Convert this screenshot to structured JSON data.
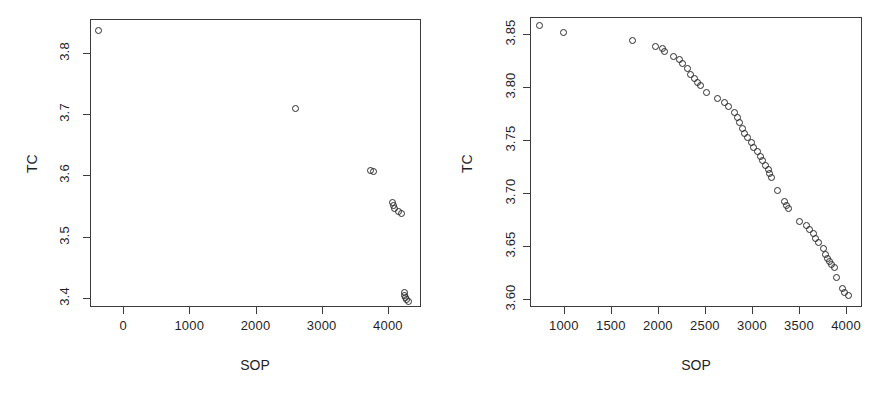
{
  "figure": {
    "background": "#ffffff",
    "point_color": "#2b2b2b",
    "axis_color": "#3c3c3c",
    "panel_count": 2
  },
  "chart_data": [
    {
      "id": "left-panel",
      "type": "scatter",
      "title": "",
      "xlabel": "SOP",
      "ylabel": "TC",
      "xticks": [
        0,
        1000,
        2000,
        3000,
        4000
      ],
      "xtick_labels": [
        "0",
        "1000",
        "2000",
        "3000",
        "4000"
      ],
      "yticks": [
        3.4,
        3.5,
        3.6,
        3.7,
        3.8
      ],
      "ytick_labels": [
        "3.4",
        "3.5",
        "3.6",
        "3.7",
        "3.8"
      ],
      "xlim": [
        -500,
        4500
      ],
      "ylim": [
        3.385,
        3.855
      ],
      "grid": false,
      "legend": null,
      "marker": "open-circle",
      "points": [
        {
          "x": -380,
          "y": 3.838
        },
        {
          "x": 2595,
          "y": 3.71
        },
        {
          "x": 3720,
          "y": 3.61
        },
        {
          "x": 3760,
          "y": 3.608
        },
        {
          "x": 4060,
          "y": 3.557
        },
        {
          "x": 4075,
          "y": 3.553
        },
        {
          "x": 4085,
          "y": 3.548
        },
        {
          "x": 4145,
          "y": 3.543
        },
        {
          "x": 4195,
          "y": 3.54
        },
        {
          "x": 4230,
          "y": 3.41
        },
        {
          "x": 4240,
          "y": 3.406
        },
        {
          "x": 4245,
          "y": 3.402
        },
        {
          "x": 4260,
          "y": 3.399
        },
        {
          "x": 4290,
          "y": 3.396
        }
      ]
    },
    {
      "id": "right-panel",
      "type": "scatter",
      "title": "",
      "xlabel": "SOP",
      "ylabel": "TC",
      "xticks": [
        1000,
        1500,
        2000,
        2500,
        3000,
        3500,
        4000
      ],
      "xtick_labels": [
        "1000",
        "1500",
        "2000",
        "2500",
        "3000",
        "3500",
        "4000"
      ],
      "yticks": [
        3.6,
        3.65,
        3.7,
        3.75,
        3.8,
        3.85
      ],
      "ytick_labels": [
        "3.60",
        "3.65",
        "3.70",
        "3.75",
        "3.80",
        "3.85"
      ],
      "xlim": [
        640,
        4170
      ],
      "ylim": [
        3.592,
        3.866
      ],
      "grid": false,
      "legend": null,
      "marker": "open-circle",
      "points": [
        {
          "x": 735,
          "y": 3.859
        },
        {
          "x": 985,
          "y": 3.852
        },
        {
          "x": 1715,
          "y": 3.845
        },
        {
          "x": 1960,
          "y": 3.839
        },
        {
          "x": 2035,
          "y": 3.837
        },
        {
          "x": 2060,
          "y": 3.834
        },
        {
          "x": 2155,
          "y": 3.83
        },
        {
          "x": 2215,
          "y": 3.827
        },
        {
          "x": 2250,
          "y": 3.823
        },
        {
          "x": 2300,
          "y": 3.818
        },
        {
          "x": 2340,
          "y": 3.813
        },
        {
          "x": 2375,
          "y": 3.809
        },
        {
          "x": 2415,
          "y": 3.805
        },
        {
          "x": 2440,
          "y": 3.802
        },
        {
          "x": 2510,
          "y": 3.796
        },
        {
          "x": 2625,
          "y": 3.79
        },
        {
          "x": 2700,
          "y": 3.786
        },
        {
          "x": 2745,
          "y": 3.782
        },
        {
          "x": 2800,
          "y": 3.777
        },
        {
          "x": 2835,
          "y": 3.772
        },
        {
          "x": 2860,
          "y": 3.767
        },
        {
          "x": 2890,
          "y": 3.762
        },
        {
          "x": 2915,
          "y": 3.757
        },
        {
          "x": 2945,
          "y": 3.753
        },
        {
          "x": 2985,
          "y": 3.748
        },
        {
          "x": 3010,
          "y": 3.744
        },
        {
          "x": 3045,
          "y": 3.74
        },
        {
          "x": 3075,
          "y": 3.735
        },
        {
          "x": 3100,
          "y": 3.731
        },
        {
          "x": 3135,
          "y": 3.727
        },
        {
          "x": 3160,
          "y": 3.723
        },
        {
          "x": 3180,
          "y": 3.719
        },
        {
          "x": 3200,
          "y": 3.715
        },
        {
          "x": 3265,
          "y": 3.703
        },
        {
          "x": 3330,
          "y": 3.693
        },
        {
          "x": 3355,
          "y": 3.689
        },
        {
          "x": 3375,
          "y": 3.686
        },
        {
          "x": 3500,
          "y": 3.674
        },
        {
          "x": 3565,
          "y": 3.67
        },
        {
          "x": 3605,
          "y": 3.666
        },
        {
          "x": 3640,
          "y": 3.662
        },
        {
          "x": 3670,
          "y": 3.658
        },
        {
          "x": 3700,
          "y": 3.654
        },
        {
          "x": 3745,
          "y": 3.648
        },
        {
          "x": 3775,
          "y": 3.643
        },
        {
          "x": 3790,
          "y": 3.639
        },
        {
          "x": 3810,
          "y": 3.636
        },
        {
          "x": 3830,
          "y": 3.633
        },
        {
          "x": 3870,
          "y": 3.63
        },
        {
          "x": 3890,
          "y": 3.621
        },
        {
          "x": 3955,
          "y": 3.61
        },
        {
          "x": 3975,
          "y": 3.607
        },
        {
          "x": 4020,
          "y": 3.604
        }
      ]
    }
  ]
}
